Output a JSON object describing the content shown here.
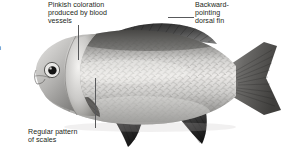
{
  "figure": {
    "background_color": "#ffffff",
    "text_color": "#231f20",
    "leader_line_color": "#58595b"
  },
  "callouts": [
    {
      "id": "pinkish-coloration",
      "text": "Pinkish coloration\nproduced by blood\nvessels",
      "target": "gill-cover-region"
    },
    {
      "id": "dorsal-fin",
      "text": "Backward-\npointing\ndorsal fin",
      "target": "dorsal-fin"
    },
    {
      "id": "scale-pattern",
      "text": "Regular pattern\nof scales",
      "target": "flank-scales"
    }
  ],
  "edge_fragments": {
    "upper": "n",
    "lower": "n"
  },
  "fish": {
    "body_fill_light": "#f2f1ef",
    "body_fill_mid": "#b9b8b6",
    "body_fill_dark": "#6e6d6b",
    "fin_dark": "#3a3a3a",
    "fin_darkest": "#1f1f1f",
    "eye_color": "#141414",
    "parts": [
      "head",
      "eye",
      "gill-cover",
      "body",
      "scales",
      "dorsal-fin",
      "caudal-fin",
      "pectoral-fin",
      "pelvic-fin",
      "anal-fin"
    ]
  }
}
